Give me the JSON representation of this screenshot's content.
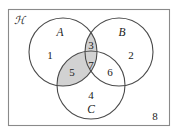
{
  "diagram": {
    "type": "venn-3-set",
    "universe": {
      "label": "ℋ",
      "label_text": "U",
      "outside_count_label": "8",
      "border_color": "#8a8a8a",
      "fill_color": "#ffffff"
    },
    "style": {
      "shaded_fill": "#d2d2d2",
      "unshaded_fill": "#ffffff",
      "circle_stroke": "#4a4a4a",
      "text_color": "#1a1a1a"
    },
    "sets": [
      {
        "id": "A",
        "label": "A",
        "cx": 63,
        "cy": 52,
        "r": 34
      },
      {
        "id": "B",
        "label": "B",
        "cx": 119,
        "cy": 52,
        "r": 34
      },
      {
        "id": "C",
        "label": "C",
        "cx": 91,
        "cy": 85,
        "r": 34
      }
    ],
    "set_label_positions": [
      {
        "id": "A",
        "x": 60,
        "y": 33
      },
      {
        "id": "B",
        "x": 122,
        "y": 33
      },
      {
        "id": "C",
        "x": 91,
        "y": 110
      }
    ],
    "regions": [
      {
        "id": "r1",
        "label": "1",
        "belongs": "A only",
        "shaded": false,
        "x": 50,
        "y": 56
      },
      {
        "id": "r2",
        "label": "2",
        "belongs": "B only",
        "shaded": false,
        "x": 131,
        "y": 56
      },
      {
        "id": "r3",
        "label": "3",
        "belongs": "A and B",
        "shaded": true,
        "x": 91,
        "y": 46
      },
      {
        "id": "r4",
        "label": "4",
        "belongs": "C only",
        "shaded": false,
        "x": 91,
        "y": 96
      },
      {
        "id": "r5",
        "label": "5",
        "belongs": "A and C",
        "shaded": true,
        "x": 72,
        "y": 73
      },
      {
        "id": "r6",
        "label": "6",
        "belongs": "B and C",
        "shaded": false,
        "x": 110,
        "y": 73
      },
      {
        "id": "r7",
        "label": "7",
        "belongs": "A, B and C",
        "shaded": true,
        "x": 91,
        "y": 66
      },
      {
        "id": "r8",
        "label": "8",
        "belongs": "outside all",
        "shaded": false,
        "x": 155,
        "y": 117
      }
    ]
  }
}
